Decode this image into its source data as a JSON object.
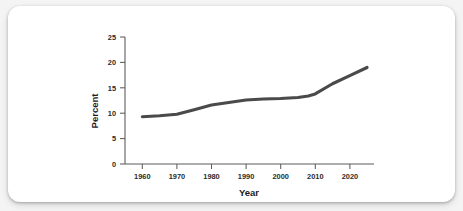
{
  "card": {
    "background_color": "#ffffff",
    "page_background_color": "#f4f4f4"
  },
  "chart_data": {
    "type": "line",
    "title": "",
    "xlabel": "Year",
    "ylabel": "Percent",
    "xlim": [
      1955,
      2027
    ],
    "ylim": [
      0,
      25
    ],
    "xticks": [
      1960,
      1970,
      1980,
      1990,
      2000,
      2010,
      2020
    ],
    "xtick_labels": [
      "1960",
      "1970",
      "1980",
      "1990",
      "2000",
      "2010",
      "2020"
    ],
    "yticks": [
      0,
      5,
      10,
      15,
      20,
      25
    ],
    "ytick_labels": [
      "0",
      "5",
      "10",
      "15",
      "20",
      "25"
    ],
    "grid": false,
    "legend": null,
    "line_color": "#4a4a4a",
    "series": [
      {
        "name": "Percent",
        "x": [
          1960,
          1965,
          1970,
          1975,
          1980,
          1985,
          1990,
          1995,
          2000,
          2005,
          2008,
          2010,
          2015,
          2020,
          2025
        ],
        "values": [
          9.3,
          9.5,
          9.8,
          10.7,
          11.6,
          12.1,
          12.6,
          12.8,
          12.9,
          13.1,
          13.4,
          13.8,
          15.8,
          17.4,
          19.0
        ]
      }
    ]
  }
}
